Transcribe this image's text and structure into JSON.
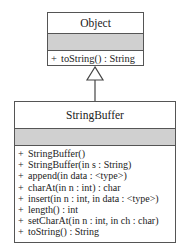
{
  "parent_class": {
    "name": "Object",
    "operations": [
      {
        "vis": "+",
        "sig": "toString() : String"
      }
    ]
  },
  "child_class": {
    "name": "StringBuffer",
    "operations": [
      {
        "vis": "+",
        "sig": "StringBuffer()"
      },
      {
        "vis": "+",
        "sig": "StringBuffer(in s : String)"
      },
      {
        "vis": "+",
        "sig": "append(in data : <type>)"
      },
      {
        "vis": "+",
        "sig": "charAt(in n : int) : char"
      },
      {
        "vis": "+",
        "sig": "insert(in n : int, in data : <type>)"
      },
      {
        "vis": "+",
        "sig": "length() : int"
      },
      {
        "vis": "+",
        "sig": "setCharAt(in n : int, in ch : char)"
      },
      {
        "vis": "+",
        "sig": "toString() : String"
      }
    ]
  },
  "relationship": {
    "type": "generalization",
    "from": "StringBuffer",
    "to": "Object"
  },
  "colors": {
    "attribute_band": "#d0d0d0",
    "border": "#555555"
  }
}
